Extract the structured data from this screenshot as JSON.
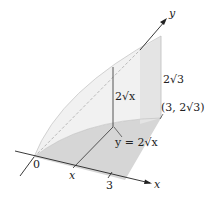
{
  "figure": {
    "colors": {
      "base_fill": "#d9d9d9",
      "wall_fill": "#ececec",
      "curve_fill": "#f2f2f2",
      "axis": "#222222",
      "edge": "#555555",
      "dashed": "#aaaaaa"
    },
    "axes": {
      "x_label": "x",
      "y_label": "y",
      "origin_label": "0"
    },
    "ticks": {
      "x_var": "x",
      "x_three": "3"
    },
    "annotations": {
      "section_height": "2√x",
      "end_height": "2√3",
      "end_point": "(3, 2√3)",
      "curve_eq": "y = 2√x"
    }
  }
}
